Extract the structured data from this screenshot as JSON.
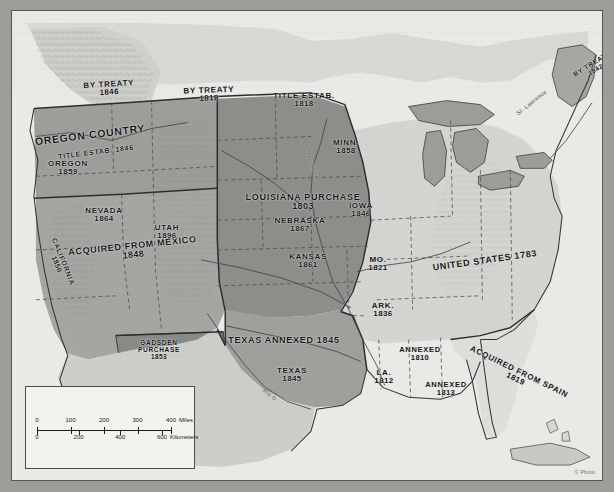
{
  "map": {
    "title": "Territorial Growth of the United States",
    "credit": "© Photo",
    "colors": {
      "frame": "#9d9d9a",
      "ocean": "#e8e8e4",
      "louisiana_purchase": "#8c8c88",
      "acquired_from_mexico": "#a3a39f",
      "oregon_country": "#9a9a96",
      "texas_annexed": "#9e9e9a",
      "united_states_1783": "#d2d2ce",
      "acquired_from_spain": "#dcdcd8",
      "gadsden_purchase": "#8a8a86",
      "canada_mexico": "#cfcfcb",
      "label_text": "#15151a",
      "border_line": "#3a3a40"
    },
    "labels": [
      {
        "name": "by-treaty-1846",
        "text": "BY TREATY",
        "date": "1846",
        "x": 97,
        "y": 78,
        "rot": -3.5,
        "size": "t8"
      },
      {
        "name": "by-treaty-1818",
        "text": "BY TREATY",
        "date": "1818",
        "x": 197,
        "y": 84,
        "rot": -2,
        "size": "t8"
      },
      {
        "name": "title-estab-1818",
        "text": "TITLE ESTAB.",
        "date": "1818",
        "x": 292,
        "y": 89,
        "rot": 0,
        "size": "t8"
      },
      {
        "name": "by-treaty-1842",
        "text": "BY TREATY",
        "date": "1842",
        "x": 582,
        "y": 56,
        "rot": -32,
        "size": "t65"
      },
      {
        "name": "oregon-country",
        "text": "OREGON COUNTRY",
        "date": "",
        "x": 78,
        "y": 124,
        "rot": -7,
        "size": "t11"
      },
      {
        "name": "oregon-title-estab",
        "text": "TITLE ESTAB. 1846",
        "date": "",
        "x": 84,
        "y": 141,
        "rot": -7,
        "size": "t7"
      },
      {
        "name": "oregon-state",
        "text": "OREGON",
        "date": "1859",
        "x": 56,
        "y": 157,
        "rot": 0,
        "size": "t8"
      },
      {
        "name": "minnesota",
        "text": "MINN.",
        "date": "1858",
        "x": 334,
        "y": 136,
        "rot": 0,
        "size": "t8"
      },
      {
        "name": "louisiana-purchase",
        "text": "LOUISIANA PURCHASE",
        "date": "1803",
        "x": 291,
        "y": 191,
        "rot": 0,
        "size": "t9"
      },
      {
        "name": "nebraska",
        "text": "NEBRASKA",
        "date": "1867",
        "x": 288,
        "y": 214,
        "rot": 0,
        "size": "t8"
      },
      {
        "name": "iowa",
        "text": "IOWA",
        "date": "1846",
        "x": 349,
        "y": 199,
        "rot": 0,
        "size": "t8"
      },
      {
        "name": "kansas",
        "text": "KANSAS",
        "date": "1861",
        "x": 296,
        "y": 250,
        "rot": 0,
        "size": "t8"
      },
      {
        "name": "missouri",
        "text": "MO.",
        "date": "1821",
        "x": 366,
        "y": 253,
        "rot": 0,
        "size": "t8"
      },
      {
        "name": "arkansas",
        "text": "ARK.",
        "date": "1836",
        "x": 371,
        "y": 299,
        "rot": 0,
        "size": "t8"
      },
      {
        "name": "nevada",
        "text": "NEVADA",
        "date": "1864",
        "x": 92,
        "y": 204,
        "rot": 0,
        "size": "t8"
      },
      {
        "name": "utah",
        "text": "UTAH",
        "date": "1896",
        "x": 155,
        "y": 221,
        "rot": 0,
        "size": "t8"
      },
      {
        "name": "acquired-from-mexico",
        "text": "ACQUIRED FROM MEXICO",
        "date": "1848",
        "x": 121,
        "y": 240,
        "rot": -6,
        "size": "t9"
      },
      {
        "name": "california",
        "text": "CALIFORNIA",
        "date": "1850",
        "x": 48,
        "y": 252,
        "rot": 68,
        "size": "t7"
      },
      {
        "name": "gadsden-purchase",
        "text": "GADSDEN PURCHASE",
        "date": "1853",
        "x": 147,
        "y": 339,
        "rot": 0,
        "size": "t65",
        "wrap": true
      },
      {
        "name": "texas-annexed",
        "text": "TEXAS ANNEXED 1845",
        "date": "",
        "x": 272,
        "y": 330,
        "rot": 0,
        "size": "t9"
      },
      {
        "name": "texas-state",
        "text": "TEXAS",
        "date": "1845",
        "x": 280,
        "y": 364,
        "rot": 0,
        "size": "t8"
      },
      {
        "name": "louisiana-state",
        "text": "LA.",
        "date": "1812",
        "x": 372,
        "y": 366,
        "rot": 0,
        "size": "t8"
      },
      {
        "name": "annexed-1810",
        "text": "ANNEXED",
        "date": "1810",
        "x": 408,
        "y": 343,
        "rot": 0,
        "size": "t75"
      },
      {
        "name": "annexed-1813",
        "text": "ANNEXED",
        "date": "1813",
        "x": 434,
        "y": 378,
        "rot": 0,
        "size": "t75"
      },
      {
        "name": "united-states-1783",
        "text": "UNITED STATES 1783",
        "date": "",
        "x": 473,
        "y": 250,
        "rot": -8,
        "size": "t9"
      },
      {
        "name": "acquired-from-spain",
        "text": "ACQUIRED FROM SPAIN",
        "date": "1819",
        "x": 505,
        "y": 365,
        "rot": 26,
        "size": "t8"
      }
    ],
    "rivers": [
      {
        "name": "mississippi-river-label",
        "text": "Mississippi",
        "x": 300,
        "y": 155,
        "rot": 72
      },
      {
        "name": "rio-grande-label",
        "text": "Rio G.",
        "x": 258,
        "y": 385,
        "rot": 38
      },
      {
        "name": "st-lawrence-label",
        "text": "St. Lawrence",
        "x": 520,
        "y": 92,
        "rot": -38
      }
    ],
    "scale": {
      "miles_unit": "Miles",
      "miles_ticks": [
        "0",
        "100",
        "200",
        "300",
        "400"
      ],
      "km_unit": "Kilometers",
      "km_ticks": [
        "0",
        "200",
        "400",
        "600"
      ]
    }
  }
}
